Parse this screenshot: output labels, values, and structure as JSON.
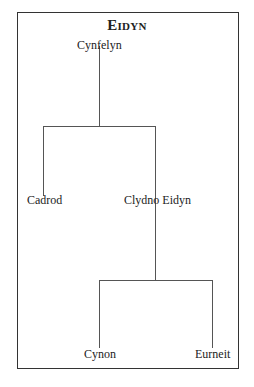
{
  "diagram": {
    "type": "family-tree",
    "title": "Eidyn",
    "nodes": [
      {
        "id": "cynfelyn",
        "label": "Cynfelyn",
        "parent": null
      },
      {
        "id": "cadrod",
        "label": "Cadrod",
        "parent": "cynfelyn"
      },
      {
        "id": "clydno",
        "label": "Clydno Eidyn",
        "parent": "cynfelyn"
      },
      {
        "id": "cynon",
        "label": "Cynon",
        "parent": "clydno"
      },
      {
        "id": "eurneit",
        "label": "Eurneit",
        "parent": "clydno"
      }
    ]
  }
}
